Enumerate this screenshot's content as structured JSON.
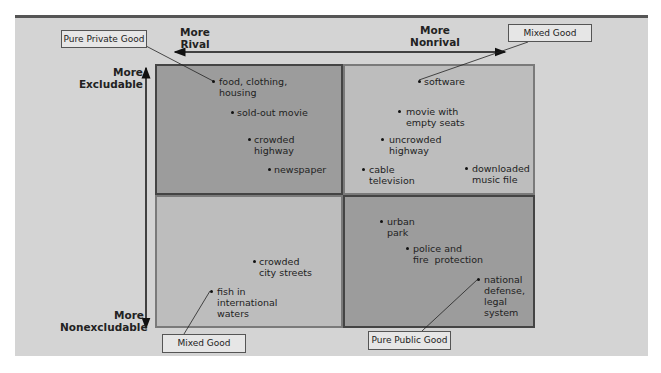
{
  "axes": {
    "top_left": "More\nRival",
    "top_right": "More\nNonrival",
    "left_top": "More\nExcludable",
    "left_bottom": "More\nNonexcludable"
  },
  "callouts": {
    "pure_private": "Pure Private Good",
    "mixed_top": "Mixed Good",
    "mixed_bottom": "Mixed Good",
    "pure_public": "Pure Public Good"
  },
  "quadrants": {
    "rival_excludable": [
      "food, clothing,\nhousing",
      "sold-out movie",
      "crowded\nhighway",
      "newspaper"
    ],
    "nonrival_excludable": [
      "software",
      "movie with\nempty seats",
      "uncrowded\nhighway",
      "cable\ntelevision",
      "downloaded\nmusic file"
    ],
    "rival_nonexcludable": [
      "crowded\ncity streets",
      "fish in\ninternational\nwaters"
    ],
    "nonrival_nonexcludable": [
      "urban\npark",
      "police and\nfire  protection",
      "national\ndefense,\nlegal\nsystem"
    ]
  },
  "colors": {
    "panel": "#d4d4d4",
    "dark_quadrant": "#9c9c9c",
    "light_quadrant": "#bdbdbd",
    "top_bar": "#555555"
  }
}
